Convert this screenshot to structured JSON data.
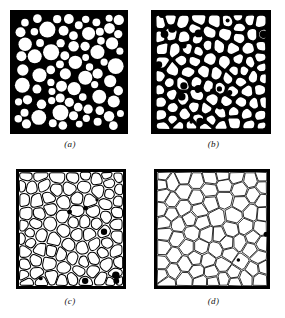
{
  "figure": {
    "background_color": "#ffffff",
    "ink_color": "#000000",
    "grain_color": "#ffffff",
    "width": 285,
    "height": 318
  },
  "panels": [
    {
      "id": "a",
      "caption": "(a)",
      "stage_label": "Initial stage - loose spherical particles",
      "x": 10,
      "y": 10,
      "w": 118,
      "h": 124,
      "frame_stroke": 4,
      "fill": "#000000",
      "grain_shape": "circle",
      "boundary_width": 0,
      "porosity_percent": 38,
      "grain_count": 92,
      "mean_grain_diameter_px": 12,
      "seed": 17
    },
    {
      "id": "b",
      "caption": "(b)",
      "stage_label": "Intermediate stage - necks formed, rounded grains",
      "x": 151,
      "y": 10,
      "w": 120,
      "h": 124,
      "frame_stroke": 4,
      "fill": "#000000",
      "grain_shape": "rounded-polygon",
      "boundary_width": 2.6,
      "porosity_percent": 22,
      "grain_count": 96,
      "mean_grain_diameter_px": 13,
      "seed": 43
    },
    {
      "id": "c",
      "caption": "(c)",
      "stage_label": "Late intermediate stage - isolated pores at triple points",
      "x": 16,
      "y": 169,
      "w": 110,
      "h": 120,
      "frame_stroke": 3,
      "fill": "#ffffff",
      "grain_shape": "rounded-polygon",
      "boundary_width": 1.9,
      "porosity_percent": 9,
      "grain_count": 88,
      "mean_grain_diameter_px": 13,
      "seed": 71
    },
    {
      "id": "d",
      "caption": "(d)",
      "stage_label": "Final stage - fully dense polycrystal",
      "x": 154,
      "y": 169,
      "w": 116,
      "h": 120,
      "frame_stroke": 3,
      "fill": "#ffffff",
      "grain_shape": "polygon",
      "boundary_width": 1.25,
      "porosity_percent": 2,
      "grain_count": 78,
      "mean_grain_diameter_px": 14,
      "seed": 99
    }
  ],
  "chart_data": {
    "type": "diagram",
    "categories": [
      "(a)",
      "(b)",
      "(c)",
      "(d)"
    ],
    "series": [
      {
        "name": "Porosity (%)",
        "values": [
          38,
          22,
          9,
          2
        ]
      },
      {
        "name": "Grain count",
        "values": [
          92,
          96,
          88,
          78
        ]
      },
      {
        "name": "Mean grain diameter (px)",
        "values": [
          12,
          13,
          13,
          14
        ]
      }
    ],
    "xlabel": "Sintering stage",
    "ylabel": "Porosity (%)",
    "legend": "none",
    "grid": false
  }
}
